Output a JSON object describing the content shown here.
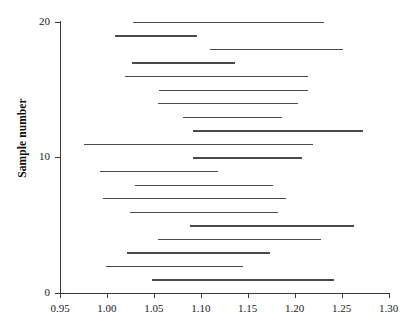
{
  "chart_data": {
    "type": "line",
    "subtype": "confidence-interval-plot",
    "title": "",
    "xlabel": "",
    "ylabel": "Sample number",
    "xlim": [
      0.95,
      1.3
    ],
    "ylim": [
      0,
      20
    ],
    "grid": false,
    "legend": null,
    "x_ticks": [
      "0.95",
      "1.00",
      "1.05",
      "1.10",
      "1.15",
      "1.20",
      "1.25",
      "1.30"
    ],
    "x_tick_values": [
      0.95,
      1.0,
      1.05,
      1.1,
      1.15,
      1.2,
      1.25,
      1.3
    ],
    "y_ticks": [
      "0",
      "10",
      "20"
    ],
    "y_tick_values": [
      0,
      10,
      20
    ],
    "series_name": "confidence interval",
    "line_color": "#4a4a4a",
    "axis_color": "#3a3a3a",
    "intervals": [
      {
        "sample": 20,
        "lower": 1.028,
        "upper": 1.231
      },
      {
        "sample": 19,
        "lower": 1.009,
        "upper": 1.096
      },
      {
        "sample": 18,
        "lower": 1.11,
        "upper": 1.252
      },
      {
        "sample": 17,
        "lower": 1.027,
        "upper": 1.137
      },
      {
        "sample": 16,
        "lower": 1.019,
        "upper": 1.214
      },
      {
        "sample": 15,
        "lower": 1.055,
        "upper": 1.214
      },
      {
        "sample": 14,
        "lower": 1.054,
        "upper": 1.204
      },
      {
        "sample": 13,
        "lower": 1.081,
        "upper": 1.186
      },
      {
        "sample": 12,
        "lower": 1.092,
        "upper": 1.273
      },
      {
        "sample": 11,
        "lower": 0.975,
        "upper": 1.22
      },
      {
        "sample": 10,
        "lower": 1.092,
        "upper": 1.208
      },
      {
        "sample": 9,
        "lower": 0.993,
        "upper": 1.118
      },
      {
        "sample": 8,
        "lower": 1.03,
        "upper": 1.177
      },
      {
        "sample": 7,
        "lower": 0.996,
        "upper": 1.191
      },
      {
        "sample": 6,
        "lower": 1.025,
        "upper": 1.182
      },
      {
        "sample": 5,
        "lower": 1.088,
        "upper": 1.263
      },
      {
        "sample": 4,
        "lower": 1.054,
        "upper": 1.228
      },
      {
        "sample": 3,
        "lower": 1.021,
        "upper": 1.174
      },
      {
        "sample": 2,
        "lower": 0.999,
        "upper": 1.145
      },
      {
        "sample": 1,
        "lower": 1.048,
        "upper": 1.242
      }
    ]
  }
}
